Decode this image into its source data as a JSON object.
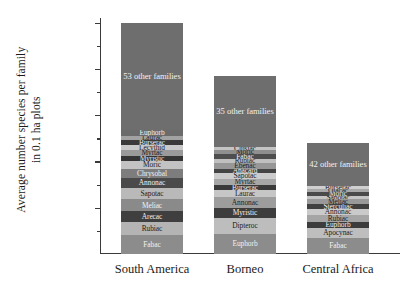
{
  "chart_data": {
    "type": "bar",
    "subtype": "stacked-bar",
    "title": "",
    "xlabel": "",
    "ylabel": "Average number species per family in 0.1 ha plots",
    "ylabel_line1": "Average number species per family",
    "ylabel_line2": "in 0.1 ha plots",
    "ylim": [
      0,
      255
    ],
    "yticks": [
      50,
      100,
      150,
      200,
      250
    ],
    "ytick_labels": [
      "50",
      "100",
      "150",
      "200",
      "250"
    ],
    "yminor_ticks": [
      25,
      75,
      125,
      175,
      225
    ],
    "grid": false,
    "legend": "none",
    "categories": [
      "South America",
      "Borneo",
      "Central Africa"
    ],
    "totals": [
      250,
      192,
      120
    ],
    "series": [
      {
        "name": "South America",
        "total": 250,
        "segments": [
          {
            "label": "Fabac",
            "value": 20,
            "color": "#8c8c8c"
          },
          {
            "label": "Rubiac",
            "value": 14,
            "color": "#b4b4b4"
          },
          {
            "label": "Arecac",
            "value": 12,
            "color": "#3f3f3f"
          },
          {
            "label": "Meliac",
            "value": 13,
            "color": "#8a8a8a"
          },
          {
            "label": "Sapotac",
            "value": 12,
            "color": "#b9b9b9"
          },
          {
            "label": "Annonac",
            "value": 11,
            "color": "#4a4a4a"
          },
          {
            "label": "Chrysobal",
            "value": 10,
            "color": "#7d7d7d"
          },
          {
            "label": "Moric",
            "value": 8,
            "color": "#c3c3c3"
          },
          {
            "label": "Myristic",
            "value": 6,
            "color": "#353535"
          },
          {
            "label": "Myrtac",
            "value": 6,
            "color": "#9a9a9a"
          },
          {
            "label": "Lecythid",
            "value": 6,
            "color": "#c9c9c9"
          },
          {
            "label": "Burserac",
            "value": 5,
            "color": "#3a3a3a"
          },
          {
            "label": "Laurac",
            "value": 5,
            "color": "#a2a2a2"
          },
          {
            "label": "Euphorb",
            "value": 6,
            "color": "#6b6b6b"
          },
          {
            "label": "53 other families",
            "value": 116,
            "color": "#6e6e6e",
            "big": true
          }
        ]
      },
      {
        "name": "Borneo",
        "total": 192,
        "segments": [
          {
            "label": "Euphorb",
            "value": 22,
            "color": "#8c8c8c"
          },
          {
            "label": "Dipteroc",
            "value": 17,
            "color": "#bdbdbd"
          },
          {
            "label": "Myristic",
            "value": 11,
            "color": "#3d3d3d"
          },
          {
            "label": "Annonac",
            "value": 11,
            "color": "#9d9d9d"
          },
          {
            "label": "Laurac",
            "value": 8,
            "color": "#c6c6c6"
          },
          {
            "label": "Burserac",
            "value": 6,
            "color": "#3a3a3a"
          },
          {
            "label": "Myrtac",
            "value": 6,
            "color": "#a7a7a7"
          },
          {
            "label": "Sapotac",
            "value": 6,
            "color": "#cccccc"
          },
          {
            "label": "Anacard",
            "value": 5,
            "color": "#454545"
          },
          {
            "label": "Ebenac",
            "value": 6,
            "color": "#979797"
          },
          {
            "label": "Rubiac",
            "value": 5,
            "color": "#c0c0c0"
          },
          {
            "label": "Fabac",
            "value": 5,
            "color": "#4e4e4e"
          },
          {
            "label": "Moric",
            "value": 4,
            "color": "#8f8f8f"
          },
          {
            "label": "Clusiac",
            "value": 4,
            "color": "#c4c4c4"
          },
          {
            "label": "35 other families",
            "value": 76,
            "color": "#6e6e6e",
            "big": true
          }
        ]
      },
      {
        "name": "Central Africa",
        "total": 120,
        "segments": [
          {
            "label": "Fabac",
            "value": 17,
            "color": "#8c8c8c"
          },
          {
            "label": "Apocynac",
            "value": 11,
            "color": "#bebebe"
          },
          {
            "label": "Euphorb",
            "value": 7,
            "color": "#3c3c3c"
          },
          {
            "label": "Rubiac",
            "value": 7,
            "color": "#a5a5a5"
          },
          {
            "label": "Annonac",
            "value": 7,
            "color": "#cacaca"
          },
          {
            "label": "Sterculiac",
            "value": 5,
            "color": "#404040"
          },
          {
            "label": "Meliac",
            "value": 5,
            "color": "#999999"
          },
          {
            "label": "Sapotac",
            "value": 4,
            "color": "#c5c5c5"
          },
          {
            "label": "Moric",
            "value": 4,
            "color": "#4a4a4a"
          },
          {
            "label": "Olacac",
            "value": 3,
            "color": "#a9a9a9"
          },
          {
            "label": "Burserac",
            "value": 3,
            "color": "#cfcfcf"
          },
          {
            "label": "42 other families",
            "value": 47,
            "color": "#6e6e6e",
            "big": true
          }
        ]
      }
    ]
  }
}
